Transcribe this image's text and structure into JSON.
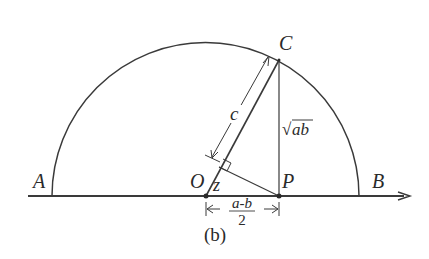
{
  "figure": {
    "caption": "(b)",
    "points": {
      "A": {
        "label": "A"
      },
      "B": {
        "label": "B"
      },
      "C": {
        "label": "C"
      },
      "O": {
        "label": "O"
      },
      "P": {
        "label": "P"
      }
    },
    "segment_labels": {
      "c": "c",
      "z": "z",
      "sqrt_ab_radical": "√",
      "sqrt_ab_radicand": "ab"
    },
    "dimension": {
      "numerator": "a-b",
      "denominator": "2"
    },
    "colors": {
      "line": "#3a3a3a",
      "text": "#2a2a2a",
      "background": "#ffffff"
    }
  }
}
